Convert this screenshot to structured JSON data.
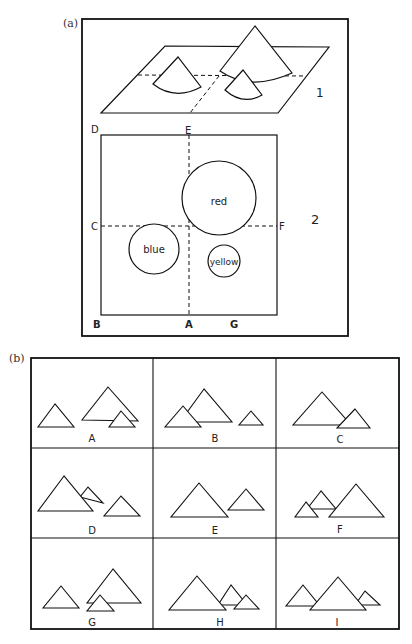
{
  "panel_a": {
    "label": "(a)",
    "view1_label": "1",
    "view2_label": "2",
    "corner_labels": {
      "D": "D",
      "E": "E",
      "C": "C",
      "F": "F",
      "B": "B",
      "A": "A",
      "G": "G"
    },
    "circles": {
      "red": "red",
      "blue": "blue",
      "yellow": "yellow"
    }
  },
  "panel_b": {
    "label": "(b)",
    "cells": [
      {
        "label": "A"
      },
      {
        "label": "B"
      },
      {
        "label": "C"
      },
      {
        "label": "D"
      },
      {
        "label": "E"
      },
      {
        "label": "F"
      },
      {
        "label": "G"
      },
      {
        "label": "H"
      },
      {
        "label": "I"
      }
    ]
  }
}
